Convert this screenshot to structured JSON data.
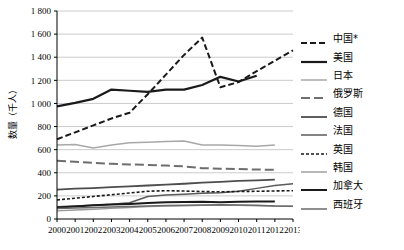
{
  "chart_data": {
    "type": "line",
    "title": "",
    "xlabel": "",
    "ylabel": "数量（千人）",
    "ylim": [
      0,
      1800
    ],
    "ytick_step": 200,
    "grid": true,
    "legend_position": "right",
    "x": [
      2000,
      2001,
      2002,
      2003,
      2004,
      2005,
      2006,
      2007,
      2008,
      2009,
      2010,
      2011,
      2012,
      2013
    ],
    "categories": [
      "2000",
      "2001",
      "2002",
      "2003",
      "2004",
      "2005",
      "2006",
      "2007",
      "2008",
      "2009",
      "2010",
      "2011",
      "2012",
      "2013"
    ],
    "yticks": [
      "0",
      "200",
      "400",
      "600",
      "800",
      "1 000",
      "1 200",
      "1 400",
      "1 600",
      "1 800"
    ],
    "series": [
      {
        "name": "中国*",
        "style": "dashed",
        "color": "#1a1a1a",
        "width": 2.0,
        "dash": "6,3",
        "values": [
          690,
          750,
          810,
          870,
          920,
          1080,
          1250,
          1420,
          1570,
          1140,
          1185,
          1280,
          1370,
          1460
        ]
      },
      {
        "name": "美国",
        "style": "solid",
        "color": "#1a1a1a",
        "width": 2.2,
        "dash": "",
        "values": [
          975,
          1005,
          1040,
          1120,
          1110,
          1100,
          1120,
          1120,
          1160,
          1230,
          1190,
          1240,
          null,
          null
        ]
      },
      {
        "name": "日本",
        "style": "solid",
        "color": "#a8a8a8",
        "width": 1.5,
        "dash": "",
        "values": [
          640,
          645,
          615,
          640,
          660,
          665,
          670,
          675,
          640,
          640,
          635,
          630,
          640,
          null
        ]
      },
      {
        "name": "俄罗斯",
        "style": "long-dash",
        "color": "#6e6e6e",
        "width": 2.0,
        "dash": "9,4",
        "values": [
          505,
          495,
          485,
          478,
          472,
          468,
          462,
          455,
          440,
          435,
          432,
          428,
          425,
          null
        ]
      },
      {
        "name": "德国",
        "style": "solid",
        "color": "#4d4d4d",
        "width": 1.8,
        "dash": "",
        "values": [
          255,
          262,
          268,
          275,
          282,
          290,
          298,
          305,
          315,
          322,
          330,
          335,
          340,
          null
        ]
      },
      {
        "name": "法国",
        "style": "solid",
        "color": "#5a5a5a",
        "width": 1.5,
        "dash": "",
        "values": [
          105,
          112,
          120,
          128,
          140,
          195,
          208,
          215,
          222,
          228,
          240,
          265,
          290,
          305
        ]
      },
      {
        "name": "英国",
        "style": "short-dash",
        "color": "#1a1a1a",
        "width": 1.6,
        "dash": "3,2",
        "values": [
          165,
          180,
          195,
          210,
          225,
          240,
          245,
          242,
          238,
          235,
          238,
          240,
          243,
          245
        ]
      },
      {
        "name": "韩国",
        "style": "solid",
        "color": "#9a9a9a",
        "width": 1.4,
        "dash": "",
        "values": [
          70,
          78,
          85,
          92,
          100,
          108,
          112,
          115,
          118,
          120,
          118,
          115,
          112,
          110
        ]
      },
      {
        "name": "加拿大",
        "style": "solid",
        "color": "#1a1a1a",
        "width": 2.0,
        "dash": "",
        "values": [
          100,
          108,
          118,
          125,
          130,
          138,
          145,
          148,
          150,
          145,
          150,
          152,
          152,
          null
        ]
      },
      {
        "name": "西班牙",
        "style": "solid",
        "color": "#6a6a6a",
        "width": 1.5,
        "dash": "",
        "values": [
          90,
          95,
          100,
          104,
          108,
          112,
          116,
          120,
          122,
          124,
          122,
          118,
          112,
          110
        ]
      }
    ]
  }
}
